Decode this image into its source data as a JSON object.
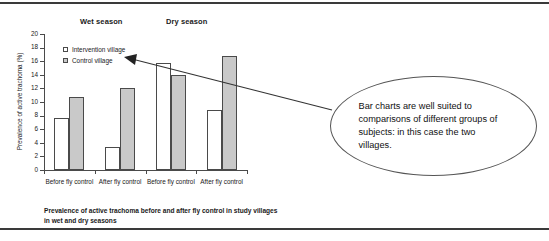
{
  "figure": {
    "season_headers": [
      {
        "label": "Wet season"
      },
      {
        "label": "Dry season"
      }
    ],
    "caption": "Prevalence of active trachoma before and after fly control in study villages in wet and dry seasons"
  },
  "callout": {
    "text": "Bar charts are well suited to comparisons of different groups of subjects: in this case the two villages."
  },
  "chart_data": {
    "type": "bar",
    "title": "",
    "xlabel": "",
    "ylabel": "Prevalence of active trachoma (%)",
    "ylim": [
      0,
      20
    ],
    "yticks": [
      0,
      2,
      4,
      6,
      8,
      10,
      12,
      14,
      16,
      18,
      20
    ],
    "ytick_labels": [
      "0",
      "2",
      "4",
      "6",
      "8",
      "10",
      "12",
      "14",
      "16",
      "18",
      "20"
    ],
    "grid": false,
    "legend_position": "upper-left-inside",
    "group_headers": [
      "Wet season",
      "Dry season"
    ],
    "categories": [
      "Before fly control",
      "After fly control",
      "Before fly control",
      "After fly control"
    ],
    "category_groups": [
      "Wet season",
      "Wet season",
      "Dry season",
      "Dry season"
    ],
    "series": [
      {
        "name": "Intervention village",
        "color": "#ffffff",
        "values": [
          7.7,
          3.4,
          15.7,
          8.8
        ]
      },
      {
        "name": "Control village",
        "color": "#c9c9c9",
        "values": [
          10.7,
          12.0,
          14.0,
          16.7
        ]
      }
    ]
  }
}
